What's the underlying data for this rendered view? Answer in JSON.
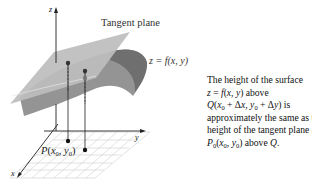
{
  "figure": {
    "labels": {
      "tangent_plane": "Tangent plane",
      "surface_eq": "z = f(x, y)",
      "axis_z": "z",
      "axis_y": "y",
      "axis_x": "x",
      "point_p": "P(x0, y0)"
    },
    "caption_lines": [
      "The height of the surface",
      "z = f(x, y) above",
      "Q(x0 + Δx, y0 + Δy) is",
      "approximately the same as the",
      "height of the tangent plane at",
      "P0(x0, y0) above Q."
    ],
    "colors": {
      "plane": "#b8b8b8",
      "surface": "#8e8e8e",
      "surface_dark": "#6f6f6f",
      "grid": "#c8c8c8",
      "axes": "#222222",
      "points": "#1a1a1a"
    }
  }
}
